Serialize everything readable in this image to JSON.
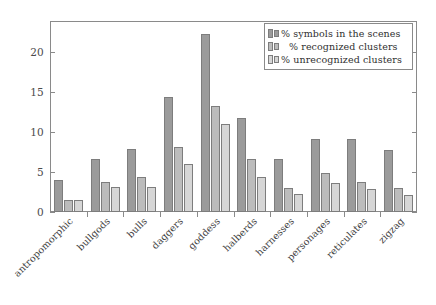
{
  "chart_data": {
    "type": "bar",
    "title": "",
    "subtitle": "",
    "xlabel": "",
    "ylabel": "",
    "ylim": [
      0,
      23.5
    ],
    "yticks": [
      0,
      5,
      10,
      15,
      20
    ],
    "ytick_labels": [
      "0",
      "5",
      "10",
      "15",
      "20"
    ],
    "grid": false,
    "legend_position": "top-right",
    "categories": [
      "antropomorphic",
      "bullgods",
      "bulls",
      "daggers",
      "goddess",
      "halberds",
      "harnesses",
      "personages",
      "reticulates",
      "zigzag"
    ],
    "series": [
      {
        "name": "% symbols in the scenes",
        "color": "#9b9b9b",
        "values": [
          4.0,
          6.6,
          7.9,
          14.4,
          22.2,
          11.7,
          6.6,
          9.1,
          9.1,
          7.8
        ]
      },
      {
        "name": "% recognized clusters",
        "color": "#bcbcbc",
        "values": [
          1.5,
          3.8,
          4.4,
          8.1,
          13.2,
          6.6,
          3.0,
          4.9,
          3.8,
          3.0
        ]
      },
      {
        "name": "% unrecognized clusters",
        "color": "#d6d6d6",
        "values": [
          1.5,
          3.1,
          3.1,
          6.0,
          11.0,
          4.4,
          2.2,
          3.6,
          2.9,
          2.1
        ]
      }
    ]
  },
  "legend": {
    "entries": [
      "% symbols in the scenes",
      "% recognized clusters",
      "% unrecognized clusters"
    ]
  },
  "axis": {
    "y_tick_labels": [
      "20",
      "15",
      "10",
      "5",
      "0"
    ]
  }
}
